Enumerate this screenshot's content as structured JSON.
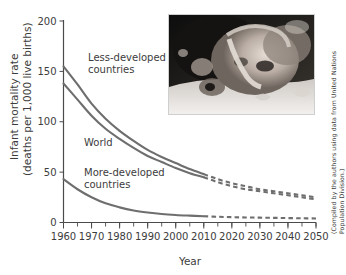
{
  "figure": {
    "credit": "(Compiled by the authors using data from United Nations Population Division.)",
    "photo_alt": "premature-newborn-infant-photo"
  },
  "chart_data": {
    "type": "line",
    "title": "",
    "xlabel": "Year",
    "ylabel": "Infant mortality rate (deaths per 1,000 live births)",
    "ylabel_line1": "Infant mortality rate",
    "ylabel_line2": "(deaths per 1,000 live births)",
    "xlim": [
      1960,
      2050
    ],
    "ylim": [
      0,
      200
    ],
    "xticks": [
      1960,
      1970,
      1980,
      1990,
      2000,
      2010,
      2020,
      2030,
      2040,
      2050
    ],
    "xtick_labels": [
      "1960",
      "1970",
      "1980",
      "1990",
      "2000",
      "2010",
      "2020",
      "2030",
      "2040",
      "2050"
    ],
    "xtick_minor_step": 5,
    "yticks": [
      0,
      50,
      100,
      150,
      200
    ],
    "ytick_labels": [
      "0",
      "50",
      "100",
      "150",
      "200"
    ],
    "grid": false,
    "legend": "inline-labels",
    "projection_start_year": 2010,
    "series": [
      {
        "name": "Less-developed countries",
        "label": "Less-developed countries",
        "label_line1": "Less-developed",
        "label_line2": "countries",
        "color": "#6e6e6e",
        "x": [
          1960,
          1965,
          1970,
          1975,
          1980,
          1985,
          1990,
          1995,
          2000,
          2005,
          2010,
          2015,
          2020,
          2025,
          2030,
          2035,
          2040,
          2045,
          2050
        ],
        "values": [
          155,
          137,
          118,
          103,
          91,
          81,
          72,
          65,
          59,
          53,
          48,
          43,
          39,
          36,
          33,
          31,
          29,
          27,
          25
        ]
      },
      {
        "name": "World",
        "label": "World",
        "label_line1": "World",
        "label_line2": "",
        "color": "#6e6e6e",
        "x": [
          1960,
          1965,
          1970,
          1975,
          1980,
          1985,
          1990,
          1995,
          2000,
          2005,
          2010,
          2015,
          2020,
          2025,
          2030,
          2035,
          2040,
          2045,
          2050
        ],
        "values": [
          138,
          122,
          106,
          93,
          83,
          74,
          66,
          60,
          54,
          49,
          45,
          40,
          36,
          33,
          31,
          29,
          27,
          25,
          23
        ]
      },
      {
        "name": "More-developed countries",
        "label": "More-developed countries",
        "label_line1": "More-developed",
        "label_line2": "countries",
        "color": "#6e6e6e",
        "x": [
          1960,
          1965,
          1970,
          1975,
          1980,
          1985,
          1990,
          1995,
          2000,
          2005,
          2010,
          2015,
          2020,
          2025,
          2030,
          2035,
          2040,
          2045,
          2050
        ],
        "values": [
          43,
          33,
          25,
          19,
          15,
          12,
          10,
          8.5,
          7.5,
          6.8,
          6.2,
          5.7,
          5.3,
          5.0,
          4.8,
          4.6,
          4.4,
          4.2,
          4.0
        ]
      }
    ]
  }
}
